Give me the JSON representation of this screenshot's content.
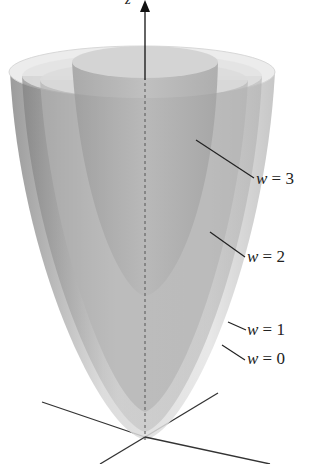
{
  "figure": {
    "axis_label_z": "z",
    "surfaces": [
      {
        "name": "w = 3",
        "var": "w",
        "eq": "=",
        "val": "3"
      },
      {
        "name": "w = 2",
        "var": "w",
        "eq": "=",
        "val": "2"
      },
      {
        "name": "w = 1",
        "var": "w",
        "eq": "=",
        "val": "1"
      },
      {
        "name": "w = 0",
        "var": "w",
        "eq": "=",
        "val": "0"
      }
    ]
  }
}
